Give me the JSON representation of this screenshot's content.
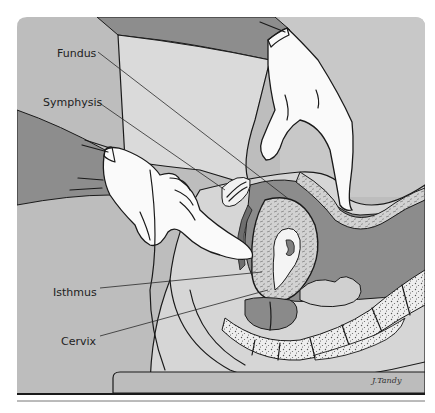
{
  "figure": {
    "labels": [
      {
        "id": "fundus",
        "text": "Fundus"
      },
      {
        "id": "symphysis",
        "text": "Symphysis"
      },
      {
        "id": "isthmus",
        "text": "Isthmus"
      },
      {
        "id": "cervix",
        "text": "Cervix"
      }
    ],
    "signature": "J.Tandy",
    "colors": {
      "background_gray": "#b9b9b9",
      "dark_gray": "#8f8f8f",
      "light_gray": "#dcdcdc",
      "glove_white": "#fbfbfb",
      "ink": "#1a1a1a",
      "page": "#ffffff"
    }
  }
}
